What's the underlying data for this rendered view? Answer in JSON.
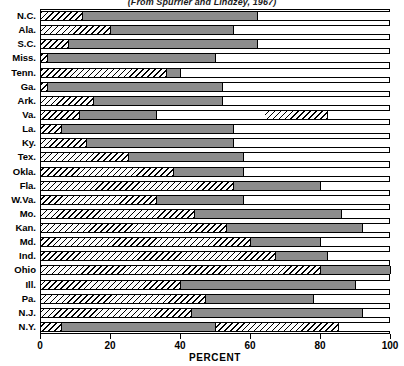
{
  "chart_data": {
    "type": "bar",
    "orientation": "horizontal",
    "stacked": true,
    "title": "(From Spurrier and Lindzey, 1967)",
    "xlabel": "PERCENT",
    "ylabel": "",
    "xlim": [
      0,
      100
    ],
    "ylim": [
      0,
      23
    ],
    "xticks": [
      0,
      20,
      40,
      60,
      80,
      100
    ],
    "xticklabels": [
      "0",
      "20",
      "40",
      "60",
      "80",
      "100"
    ],
    "grid": false,
    "legend": "none",
    "categories": [
      "N.C.",
      "Ala.",
      "S.C.",
      "Miss.",
      "Tenn.",
      "Ga.",
      "Ark.",
      "Va.",
      "La.",
      "Ky.",
      "Tex.",
      "Okla.",
      "Fla.",
      "W.Va.",
      "Mo.",
      "Kan.",
      "Md.",
      "Ind.",
      "Ohio",
      "Ill.",
      "Pa.",
      "N.J.",
      "N.Y."
    ],
    "series": [
      {
        "name": "hatched",
        "fill": "diagonal-hatch",
        "values": [
          12,
          20,
          8,
          2,
          36,
          2,
          15,
          11,
          6,
          13,
          25,
          38,
          55,
          33,
          44,
          53,
          60,
          67,
          80,
          40,
          47,
          43,
          6
        ]
      },
      {
        "name": "gray",
        "fill": "solid-gray",
        "color": "#8c8c8c",
        "values": [
          50,
          35,
          54,
          48,
          4,
          50,
          37,
          22,
          49,
          42,
          33,
          20,
          25,
          25,
          42,
          39,
          20,
          15,
          20,
          50,
          31,
          49,
          44
        ]
      },
      {
        "name": "white",
        "fill": "solid-white",
        "color": "#ffffff",
        "values": [
          38,
          45,
          38,
          50,
          60,
          48,
          48,
          67,
          45,
          45,
          42,
          42,
          20,
          42,
          14,
          8,
          20,
          18,
          0,
          10,
          22,
          8,
          50
        ]
      }
    ],
    "cumulative_boundaries": [
      {
        "category": "N.C.",
        "hatch_end": 12,
        "gray_end": 62,
        "total": 100
      },
      {
        "category": "Ala.",
        "hatch_end": 20,
        "gray_end": 55,
        "total": 100
      },
      {
        "category": "S.C.",
        "hatch_end": 8,
        "gray_end": 62,
        "total": 100
      },
      {
        "category": "Miss.",
        "hatch_end": 2,
        "gray_end": 50,
        "total": 100
      },
      {
        "category": "Tenn.",
        "hatch_end": 36,
        "gray_end": 40,
        "total": 100
      },
      {
        "category": "Ga.",
        "hatch_end": 2,
        "gray_end": 52,
        "total": 100
      },
      {
        "category": "Ark.",
        "hatch_end": 15,
        "gray_end": 52,
        "total": 100
      },
      {
        "category": "Va.",
        "hatch_end": 11,
        "gray_end": 33,
        "total": 100,
        "extra_hatch": [
          64,
          82
        ]
      },
      {
        "category": "La.",
        "hatch_end": 6,
        "gray_end": 55,
        "total": 100
      },
      {
        "category": "Ky.",
        "hatch_end": 13,
        "gray_end": 55,
        "total": 100
      },
      {
        "category": "Tex.",
        "hatch_end": 25,
        "gray_end": 58,
        "total": 100
      },
      {
        "category": "Okla.",
        "hatch_end": 38,
        "gray_end": 58,
        "total": 100
      },
      {
        "category": "Fla.",
        "hatch_end": 55,
        "gray_end": 80,
        "total": 100
      },
      {
        "category": "W.Va.",
        "hatch_end": 33,
        "gray_end": 58,
        "total": 100
      },
      {
        "category": "Mo.",
        "hatch_end": 44,
        "gray_end": 86,
        "total": 100
      },
      {
        "category": "Kan.",
        "hatch_end": 53,
        "gray_end": 92,
        "total": 100
      },
      {
        "category": "Md.",
        "hatch_end": 60,
        "gray_end": 80,
        "total": 100
      },
      {
        "category": "Ind.",
        "hatch_end": 67,
        "gray_end": 82,
        "total": 100
      },
      {
        "category": "Ohio",
        "hatch_end": 80,
        "gray_end": 100,
        "total": 100
      },
      {
        "category": "Ill.",
        "hatch_end": 40,
        "gray_end": 90,
        "total": 100
      },
      {
        "category": "Pa.",
        "hatch_end": 47,
        "gray_end": 78,
        "total": 100
      },
      {
        "category": "N.J.",
        "hatch_end": 43,
        "gray_end": 92,
        "total": 100
      },
      {
        "category": "N.Y.",
        "hatch_end": 6,
        "gray_end": 50,
        "total": 100,
        "extra_hatch": [
          50,
          85
        ]
      }
    ]
  }
}
